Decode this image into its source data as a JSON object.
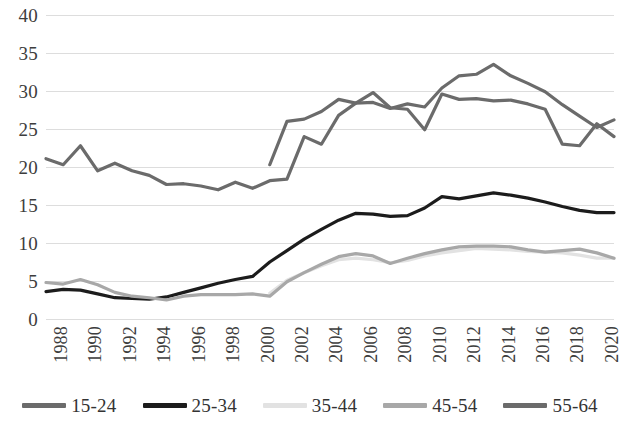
{
  "chart_data": {
    "type": "line",
    "title": "",
    "xlabel": "",
    "ylabel": "",
    "ylim": [
      0,
      40
    ],
    "y_ticks": [
      0,
      5,
      10,
      15,
      20,
      25,
      30,
      35,
      40
    ],
    "grid": true,
    "legend_position": "bottom",
    "x": [
      1988,
      1989,
      1990,
      1991,
      1992,
      1993,
      1994,
      1995,
      1996,
      1997,
      1998,
      1999,
      2000,
      2001,
      2002,
      2003,
      2004,
      2005,
      2006,
      2007,
      2008,
      2009,
      2010,
      2011,
      2012,
      2013,
      2014,
      2015,
      2016,
      2017,
      2018,
      2019,
      2020,
      2021
    ],
    "x_tick_labels": [
      "1988",
      "1990",
      "1992",
      "1994",
      "1996",
      "1998",
      "2000",
      "2002",
      "2004",
      "2006",
      "2008",
      "2010",
      "2012",
      "2014",
      "2016",
      "2018",
      "2020"
    ],
    "series": [
      {
        "name": "15-24",
        "color": "#6b6b6b",
        "values": [
          null,
          null,
          null,
          null,
          null,
          null,
          null,
          null,
          null,
          null,
          null,
          null,
          null,
          20.3,
          26.0,
          26.3,
          27.3,
          28.9,
          28.4,
          29.8,
          27.8,
          27.6,
          24.9,
          29.6,
          28.9,
          29.0,
          28.7,
          28.8,
          28.3,
          27.6,
          23.0,
          22.8,
          25.7,
          24.0
        ]
      },
      {
        "name": "25-34",
        "color": "#1c1c1c",
        "values": [
          3.6,
          3.9,
          3.8,
          3.3,
          2.8,
          2.7,
          2.6,
          2.9,
          3.5,
          4.1,
          4.7,
          5.2,
          5.6,
          7.5,
          9.0,
          10.5,
          11.8,
          13.0,
          13.9,
          13.8,
          13.5,
          13.6,
          14.6,
          16.1,
          15.8,
          16.2,
          16.6,
          16.3,
          15.9,
          15.4,
          14.8,
          14.3,
          14.0,
          14.0
        ]
      },
      {
        "name": "35-44",
        "color": "#e2e2e2",
        "values": [
          null,
          null,
          null,
          null,
          null,
          null,
          null,
          null,
          null,
          null,
          null,
          null,
          null,
          3.4,
          5.1,
          6.1,
          7.0,
          7.8,
          8.0,
          7.8,
          7.4,
          7.7,
          8.3,
          8.7,
          9.0,
          9.3,
          9.2,
          9.1,
          8.9,
          8.8,
          8.7,
          8.4,
          8.0,
          8.0
        ]
      },
      {
        "name": "45-54",
        "color": "#a8a8a8",
        "values": [
          4.8,
          4.6,
          5.2,
          4.5,
          3.5,
          3.0,
          2.8,
          2.5,
          3.0,
          3.2,
          3.2,
          3.2,
          3.3,
          3.0,
          4.9,
          6.1,
          7.2,
          8.2,
          8.6,
          8.3,
          7.3,
          8.0,
          8.6,
          9.1,
          9.5,
          9.6,
          9.6,
          9.5,
          9.1,
          8.8,
          9.0,
          9.2,
          8.7,
          8.0
        ]
      },
      {
        "name": "55-64",
        "color": "#6b6b6b",
        "values": [
          21.1,
          20.3,
          22.8,
          19.5,
          20.5,
          19.5,
          18.9,
          17.7,
          17.8,
          17.5,
          17.0,
          18.0,
          17.2,
          18.2,
          18.4,
          24.0,
          23.0,
          26.8,
          28.4,
          28.5,
          27.7,
          28.3,
          27.9,
          30.4,
          32.0,
          32.2,
          33.5,
          32.0,
          31.0,
          29.9,
          28.2,
          26.7,
          25.2,
          26.2
        ]
      }
    ]
  },
  "axes": {
    "y_labels": [
      "40",
      "35",
      "30",
      "25",
      "20",
      "15",
      "10",
      "5",
      "0"
    ],
    "x_labels": [
      "1988",
      "1990",
      "1992",
      "1994",
      "1996",
      "1998",
      "2000",
      "2002",
      "2004",
      "2006",
      "2008",
      "2010",
      "2012",
      "2014",
      "2016",
      "2018",
      "2020"
    ]
  },
  "legend": {
    "items": [
      {
        "label": "15-24",
        "color": "#6b6b6b"
      },
      {
        "label": "25-34",
        "color": "#1c1c1c"
      },
      {
        "label": "35-44",
        "color": "#e2e2e2"
      },
      {
        "label": "45-54",
        "color": "#a8a8a8"
      },
      {
        "label": "55-64",
        "color": "#6b6b6b"
      }
    ]
  }
}
